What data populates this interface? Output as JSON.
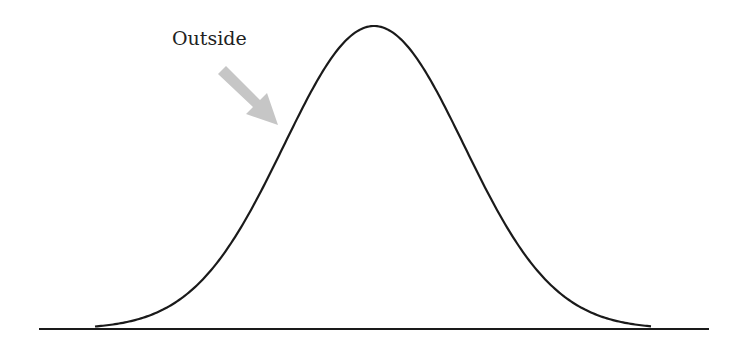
{
  "diagram": {
    "type": "bell-curve",
    "annotation": {
      "label": "Outside",
      "arrow_icon": "arrow-down-right-icon",
      "arrow_color": "#c6c6c6"
    },
    "curve_color": "#1a1a1a",
    "baseline_color": "#1a1a1a"
  }
}
